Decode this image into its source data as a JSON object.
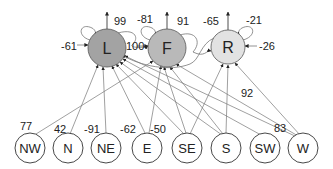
{
  "diagram": {
    "top_nodes": [
      {
        "id": "L",
        "label": "L",
        "cx": 107,
        "cy": 48,
        "r": 19,
        "fill": "#a3a3a3",
        "bias_label": "-61",
        "self_label": "99"
      },
      {
        "id": "F",
        "label": "F",
        "cx": 167,
        "cy": 48,
        "r": 19,
        "fill": "#b9b9b9",
        "bias_label": "100",
        "self_label": "-81",
        "cross_label": "91"
      },
      {
        "id": "R",
        "label": "R",
        "cx": 228,
        "cy": 47,
        "r": 17,
        "fill": "#e2e2e2",
        "bias_label": "-65",
        "self_label": "-21",
        "side_label": "-26"
      }
    ],
    "bottom_nodes": [
      {
        "id": "NW",
        "label": "NW",
        "cx": 30,
        "cy": 148,
        "weight_label": "77"
      },
      {
        "id": "N",
        "label": "N",
        "cx": 68,
        "cy": 148,
        "weight_label": "42"
      },
      {
        "id": "NE",
        "label": "NE",
        "cx": 106,
        "cy": 148,
        "weight_label": "-91"
      },
      {
        "id": "E",
        "label": "E",
        "cx": 147,
        "cy": 148,
        "weight_label": "-62"
      },
      {
        "id": "SE",
        "label": "SE",
        "cx": 187,
        "cy": 148,
        "weight_label": "-50"
      },
      {
        "id": "S",
        "label": "S",
        "cx": 226,
        "cy": 148,
        "weight_label": ""
      },
      {
        "id": "SW",
        "label": "SW",
        "cx": 265,
        "cy": 148,
        "weight_label": ""
      },
      {
        "id": "W",
        "label": "W",
        "cx": 303,
        "cy": 148,
        "weight_label": "83"
      }
    ],
    "edge_labels": {
      "mid_right": "92"
    }
  }
}
